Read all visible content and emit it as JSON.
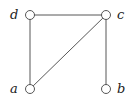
{
  "graph": {
    "nodes": [
      {
        "id": "d",
        "label": "d",
        "x": 30,
        "y": 15,
        "label_side": "left"
      },
      {
        "id": "c",
        "label": "c",
        "x": 106,
        "y": 15,
        "label_side": "right"
      },
      {
        "id": "a",
        "label": "a",
        "x": 30,
        "y": 89,
        "label_side": "left"
      },
      {
        "id": "b",
        "label": "b",
        "x": 106,
        "y": 89,
        "label_side": "right"
      }
    ],
    "edges": [
      {
        "from": "d",
        "to": "c"
      },
      {
        "from": "d",
        "to": "a"
      },
      {
        "from": "a",
        "to": "c"
      },
      {
        "from": "c",
        "to": "b"
      }
    ]
  }
}
